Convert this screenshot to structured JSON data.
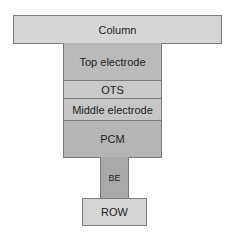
{
  "diagram": {
    "column": {
      "label": "Column",
      "color": "#d6d6d6"
    },
    "stack": [
      {
        "label": "Top electrode",
        "color": "#bababa"
      },
      {
        "label": "OTS",
        "color": "#c9c9c9"
      },
      {
        "label": "Middle electrode",
        "color": "#c6c6c6"
      },
      {
        "label": "PCM",
        "color": "#b5b5b5"
      }
    ],
    "bottom_electrode": {
      "label": "BE",
      "color": "#a9a9a9"
    },
    "row": {
      "label": "ROW",
      "color": "#d6d6d6"
    }
  }
}
